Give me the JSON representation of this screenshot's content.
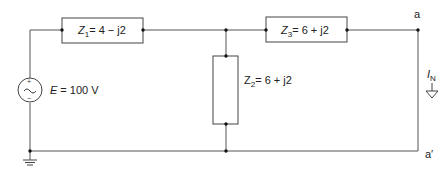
{
  "circuit": {
    "source": {
      "label": "E = 100 V",
      "symbol": "E",
      "value": "100 V",
      "type": "ac-voltage-source",
      "polarity": [
        "+",
        "−"
      ]
    },
    "impedances": [
      {
        "name": "Z1",
        "symbol": "Z",
        "sub": "1",
        "value": "= 4 − j2"
      },
      {
        "name": "Z2",
        "symbol": "Z",
        "sub": "2",
        "value": "= 6 + j2"
      },
      {
        "name": "Z3",
        "symbol": "Z",
        "sub": "3",
        "value": "= 6 + j2"
      }
    ],
    "terminals": {
      "a": "a",
      "a_prime": "a′"
    },
    "current": {
      "symbol": "I",
      "sub": "N"
    }
  }
}
